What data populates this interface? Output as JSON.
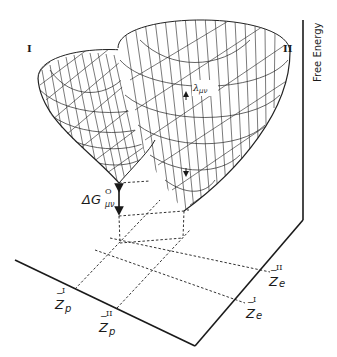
{
  "figure": {
    "well_labels": {
      "left": "I",
      "right": "II"
    },
    "axis_title": "Free Energy",
    "annotations": {
      "delta_g": {
        "symbol": "ΔG",
        "superscript": "O",
        "subscript": "μν"
      },
      "lambda": {
        "symbol": "λ",
        "subscript": "μν"
      }
    },
    "axis_ticks": {
      "zp_I": {
        "base": "Z",
        "bar": "−",
        "superscript": "I",
        "subscript": "p"
      },
      "zp_II": {
        "base": "Z",
        "bar": "−",
        "superscript": "II",
        "subscript": "p"
      },
      "ze_II": {
        "base": "Z",
        "bar": "−",
        "superscript": "II",
        "subscript": "e"
      },
      "ze_I": {
        "base": "Z",
        "bar": "−",
        "superscript": "I",
        "subscript": "e"
      }
    },
    "colors": {
      "line": "#1a1a1a",
      "background": "#ffffff"
    }
  }
}
